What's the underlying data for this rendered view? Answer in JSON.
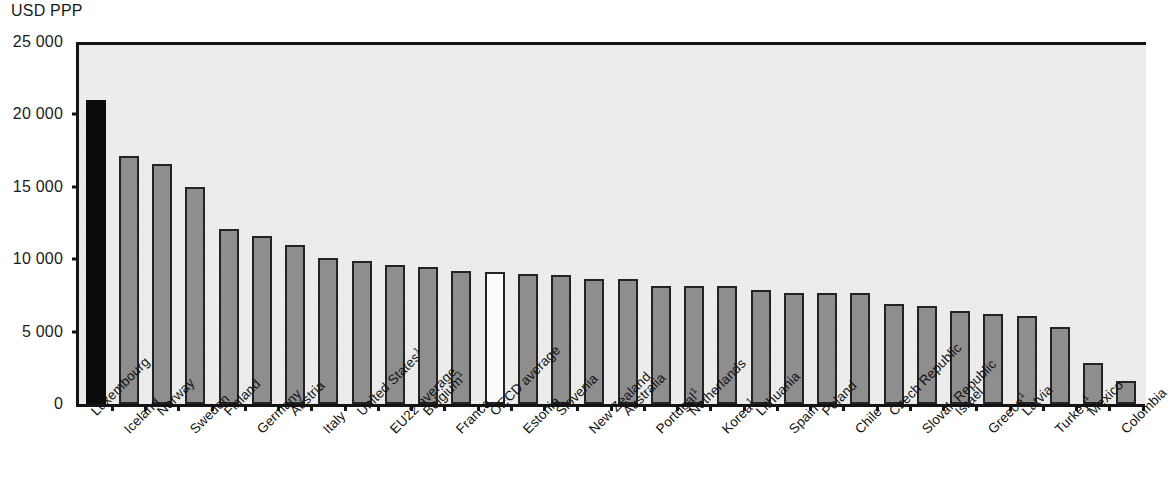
{
  "axis": {
    "unit_label": "USD PPP",
    "y_ticks": [
      "25 000",
      "20 000",
      "15 000",
      "10 000",
      "5 000",
      "0"
    ]
  },
  "colors": {
    "highlight_bar": "#0b0b0b",
    "standard_bar": "#8e8e8e",
    "average_bar": "#fbfbfb",
    "bar_border": "#232323",
    "plot_background": "#eeeeee",
    "axis_line": "#141414"
  },
  "chart_data": {
    "type": "bar",
    "title": "",
    "subtitle": "",
    "xlabel": "",
    "ylabel": "USD PPP",
    "ylim": [
      0,
      25000
    ],
    "ytick_values": [
      0,
      5000,
      10000,
      15000,
      20000,
      25000
    ],
    "grid": false,
    "legend_position": "none",
    "orientation": "vertical",
    "categories": [
      "Luxembourg",
      "Iceland",
      "Norway",
      "Sweden",
      "Finland",
      "Germany",
      "Austria",
      "Italy",
      "United States",
      "EU22 average",
      "Belgium",
      "France",
      "OECD average",
      "Estonia",
      "Slovenia",
      "New Zealand",
      "Australia",
      "Portugal",
      "Netherlands",
      "Korea",
      "Lithuania",
      "Spain",
      "Poland",
      "Chile",
      "Czech Republic",
      "Slovak Republic",
      "Israel",
      "Greece",
      "Latvia",
      "Turkey",
      "Mexico",
      "Colombia"
    ],
    "category_footnotes": {
      "United States": "1",
      "Belgium": "1",
      "Portugal": "1",
      "Korea": "1",
      "Greece": "1",
      "Turkey": "1"
    },
    "values": [
      21000,
      17100,
      16600,
      15000,
      12100,
      11600,
      11000,
      10100,
      9900,
      9600,
      9450,
      9200,
      9150,
      8950,
      8900,
      8650,
      8600,
      8150,
      8150,
      8150,
      7900,
      7650,
      7700,
      7650,
      6900,
      6750,
      6400,
      6200,
      6100,
      5300,
      2800,
      1600
    ],
    "bar_styles": [
      "highlight",
      "standard",
      "standard",
      "standard",
      "standard",
      "standard",
      "standard",
      "standard",
      "standard",
      "standard",
      "standard",
      "standard",
      "average",
      "standard",
      "standard",
      "standard",
      "standard",
      "standard",
      "standard",
      "standard",
      "standard",
      "standard",
      "standard",
      "standard",
      "standard",
      "standard",
      "standard",
      "standard",
      "standard",
      "standard",
      "standard",
      "standard"
    ]
  }
}
